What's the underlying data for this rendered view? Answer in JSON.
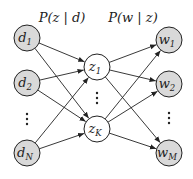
{
  "headers": {
    "left": "P(z | d)",
    "right": "P(w | z)"
  },
  "documents": [
    {
      "id": "d1",
      "base": "d",
      "sub": "1"
    },
    {
      "id": "d2",
      "base": "d",
      "sub": "2"
    },
    {
      "id": "dN",
      "base": "d",
      "sub": "N"
    }
  ],
  "topics": [
    {
      "id": "z1",
      "base": "z",
      "sub": "1"
    },
    {
      "id": "zK",
      "base": "z",
      "sub": "K"
    }
  ],
  "words": [
    {
      "id": "w1",
      "base": "w",
      "sub": "1"
    },
    {
      "id": "w2",
      "base": "w",
      "sub": "2"
    },
    {
      "id": "wM",
      "base": "w",
      "sub": "M"
    }
  ],
  "ellipsis": "⋮",
  "colors": {
    "observed_fill": "#d9d9d9",
    "latent_fill": "#ffffff",
    "stroke": "#222222"
  }
}
